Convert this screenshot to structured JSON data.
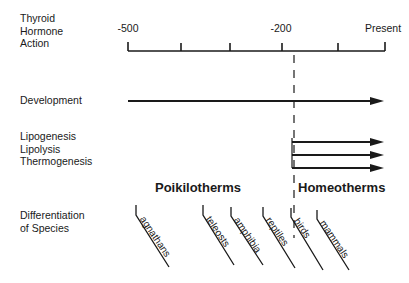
{
  "diagram": {
    "row_labels": {
      "thyroid": [
        "Thyroid",
        "Hormone",
        "Action"
      ],
      "development": "Development",
      "metabolic": [
        "Lipogenesis",
        "Lipolysis",
        "Thermogenesis"
      ],
      "differentiation": [
        "Differentiation",
        "of Species"
      ]
    },
    "timeline": {
      "labels": [
        {
          "text": "-500",
          "x": 128
        },
        {
          "text": "-200",
          "x": 281
        },
        {
          "text": "Present",
          "x": 385
        }
      ],
      "ticks_x": [
        128,
        181,
        230,
        282,
        338,
        385
      ]
    },
    "groups": {
      "poikilotherms": "Poikilotherms",
      "homeotherms": "Homeotherms"
    },
    "species": [
      "agnathans",
      "teleosts",
      "amphibia",
      "reptiles",
      "birds",
      "mammals"
    ],
    "line_color": "#1a1a1a"
  }
}
